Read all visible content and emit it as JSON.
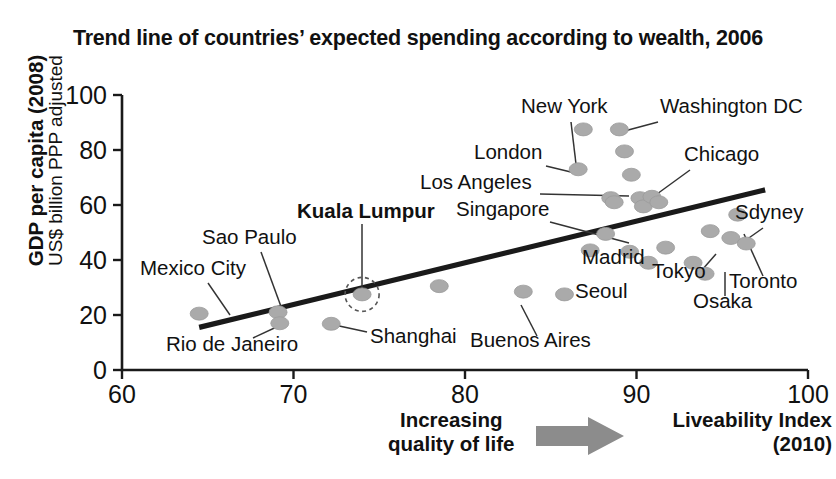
{
  "chart_data": {
    "type": "scatter",
    "title": "Trend line of countries’ expected spending according to wealth, 2006",
    "xlabel": "Liveability Index (2010)",
    "ylabel": "GDP per capita (2008) US$ billion PPP adjusted",
    "xlim": [
      60,
      100
    ],
    "ylim": [
      0,
      100
    ],
    "xticks": [
      60,
      70,
      80,
      90,
      100
    ],
    "yticks": [
      0,
      20,
      40,
      60,
      80,
      100
    ],
    "grid": false,
    "legend": "none",
    "axis_note_left": "Increasing quality of life",
    "axis_note_right": "Liveability Index (2010)",
    "trendline": {
      "label": "trend line",
      "x": [
        64.5,
        97.5
      ],
      "y": [
        15.5,
        65.5
      ]
    },
    "highlighted_point": "Kuala Lumpur",
    "points": [
      {
        "name": "Mexico City",
        "x": 64.5,
        "y": 20.5,
        "labeled": true
      },
      {
        "name": "Sao Paulo",
        "x": 69.1,
        "y": 21.0,
        "labeled": true
      },
      {
        "name": "Rio de Janeiro",
        "x": 69.2,
        "y": 17.0,
        "labeled": true
      },
      {
        "name": "Shanghai",
        "x": 72.2,
        "y": 16.8,
        "labeled": true
      },
      {
        "name": "Kuala Lumpur",
        "x": 74.0,
        "y": 27.5,
        "labeled": true
      },
      {
        "name": "unlabeled-1",
        "x": 78.5,
        "y": 30.5,
        "labeled": false
      },
      {
        "name": "Buenos Aires",
        "x": 83.4,
        "y": 28.5,
        "labeled": true
      },
      {
        "name": "Seoul",
        "x": 85.8,
        "y": 27.5,
        "labeled": true
      },
      {
        "name": "London",
        "x": 86.6,
        "y": 73.0,
        "labeled": true
      },
      {
        "name": "unlabeled-2",
        "x": 86.9,
        "y": 87.5,
        "labeled": false
      },
      {
        "name": "Madrid",
        "x": 87.3,
        "y": 43.5,
        "labeled": true
      },
      {
        "name": "Singapore",
        "x": 88.2,
        "y": 49.5,
        "labeled": true
      },
      {
        "name": "Los Angeles",
        "x": 88.5,
        "y": 62.5,
        "labeled": true
      },
      {
        "name": "unlabeled-3",
        "x": 88.7,
        "y": 61.0,
        "labeled": false
      },
      {
        "name": "Washington DC",
        "x": 89.0,
        "y": 87.5,
        "labeled": true
      },
      {
        "name": "unlabeled-4",
        "x": 89.3,
        "y": 79.5,
        "labeled": false
      },
      {
        "name": "unlabeled-5",
        "x": 89.6,
        "y": 43.0,
        "labeled": false
      },
      {
        "name": "unlabeled-6",
        "x": 89.7,
        "y": 71.0,
        "labeled": false
      },
      {
        "name": "unlabeled-7",
        "x": 90.2,
        "y": 62.5,
        "labeled": false
      },
      {
        "name": "unlabeled-8",
        "x": 90.4,
        "y": 59.5,
        "labeled": false
      },
      {
        "name": "unlabeled-9",
        "x": 90.7,
        "y": 39.0,
        "labeled": false
      },
      {
        "name": "unlabeled-10",
        "x": 90.9,
        "y": 63.0,
        "labeled": false
      },
      {
        "name": "Chicago",
        "x": 91.3,
        "y": 61.0,
        "labeled": true
      },
      {
        "name": "unlabeled-11",
        "x": 91.7,
        "y": 44.5,
        "labeled": false
      },
      {
        "name": "Tokyo",
        "x": 93.3,
        "y": 39.0,
        "labeled": true
      },
      {
        "name": "Osaka",
        "x": 94.0,
        "y": 35.0,
        "labeled": true
      },
      {
        "name": "unlabeled-12",
        "x": 94.3,
        "y": 50.5,
        "labeled": false
      },
      {
        "name": "Sdyney",
        "x": 95.5,
        "y": 48.0,
        "labeled": true
      },
      {
        "name": "unlabeled-13",
        "x": 95.9,
        "y": 56.5,
        "labeled": false
      },
      {
        "name": "Toronto",
        "x": 96.4,
        "y": 46.0,
        "labeled": true
      }
    ],
    "annotations": [
      {
        "text": "Mexico City",
        "bold": false,
        "lx": 140,
        "ly": 275,
        "leader": [
          208,
          283,
          230,
          315
        ]
      },
      {
        "text": "Sao Paulo",
        "bold": false,
        "lx": 202,
        "ly": 244,
        "leader": [
          261,
          252,
          283,
          312
        ]
      },
      {
        "text": "Rio de Janeiro",
        "bold": false,
        "lx": 166,
        "ly": 351,
        "leader": [
          253,
          338,
          283,
          324
        ]
      },
      {
        "text": "Shanghai",
        "bold": false,
        "lx": 370,
        "ly": 343,
        "leader": [
          367,
          332,
          330,
          324
        ]
      },
      {
        "text": "Kuala Lumpur",
        "bold": true,
        "lx": 297,
        "ly": 218,
        "leader": [
          362,
          224,
          362,
          290
        ]
      },
      {
        "text": "Buenos Aires",
        "bold": false,
        "lx": 470,
        "ly": 347,
        "leader": [
          537,
          336,
          521,
          305
        ]
      },
      {
        "text": "Seoul",
        "bold": false,
        "lx": 575,
        "ly": 298,
        "leader": null
      },
      {
        "text": "London",
        "bold": false,
        "lx": 474,
        "ly": 159,
        "leader": [
          546,
          166,
          575,
          173
        ]
      },
      {
        "text": "Madrid",
        "bold": false,
        "lx": 582,
        "ly": 264,
        "leader": null
      },
      {
        "text": "Singapore",
        "bold": false,
        "lx": 456,
        "ly": 216,
        "leader": [
          550,
          222,
          629,
          243
        ]
      },
      {
        "text": "Los Angeles",
        "bold": false,
        "lx": 420,
        "ly": 189,
        "leader": [
          540,
          194,
          629,
          196
        ]
      },
      {
        "text": "New York",
        "bold": false,
        "lx": 521,
        "ly": 113,
        "leader": [
          571,
          122,
          576,
          164
        ]
      },
      {
        "text": "Washington DC",
        "bold": false,
        "lx": 660,
        "ly": 113,
        "leader": [
          658,
          122,
          617,
          133
        ]
      },
      {
        "text": "Chicago",
        "bold": false,
        "lx": 684,
        "ly": 161,
        "leader": [
          690,
          170,
          657,
          194
        ]
      },
      {
        "text": "Tokyo",
        "bold": false,
        "lx": 652,
        "ly": 278,
        "leader": [
          702,
          270,
          716,
          254
        ]
      },
      {
        "text": "Osaka",
        "bold": false,
        "lx": 693,
        "ly": 308,
        "leader": [
          725,
          296,
          725,
          272
        ]
      },
      {
        "text": "Toronto",
        "bold": false,
        "lx": 729,
        "ly": 288,
        "leader": [
          763,
          276,
          744,
          234
        ]
      },
      {
        "text": "Sdyney",
        "bold": false,
        "lx": 735,
        "ly": 219,
        "leader": [
          763,
          228,
          746,
          240
        ]
      }
    ]
  },
  "header": {
    "title": "Trend line of countries’ expected spending according to wealth, 2006"
  },
  "y_axis": {
    "title_main": "GDP per capita (2008)",
    "title_sub": "US$ billion PPP adjusted"
  },
  "x_axis": {
    "caption_left_line1": "Increasing",
    "caption_left_line2": "quality of life",
    "caption_right_line1": "Liveability Index",
    "caption_right_line2": "(2010)",
    "arrow_icon": "right-arrow-icon",
    "arrow_color": "#8c8c8c"
  },
  "style": {
    "point_color": "#aaaaaa",
    "line_color": "#1a1a1a",
    "background": "#ffffff"
  }
}
